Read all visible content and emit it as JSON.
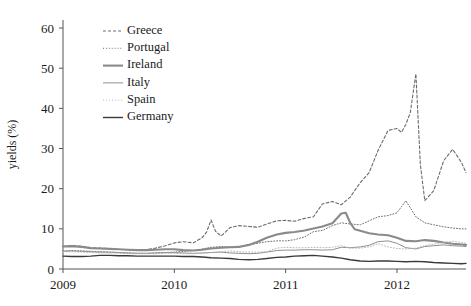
{
  "chart_data": {
    "type": "line",
    "title": "",
    "xlabel": "",
    "ylabel": "yields (%)",
    "xlim": [
      2009.0,
      2012.62
    ],
    "ylim": [
      0,
      62
    ],
    "grid": false,
    "legend_position": "top-left-inside",
    "xticks": [
      2009,
      2010,
      2011,
      2012
    ],
    "xticklabels": [
      "2009",
      "2010",
      "2011",
      "2012"
    ],
    "yticks": [
      0,
      10,
      20,
      30,
      40,
      50,
      60
    ],
    "yticklabels": [
      "0",
      "10",
      "20",
      "30",
      "40",
      "50",
      "60"
    ],
    "series": [
      {
        "name": "Greece",
        "style": "dashed",
        "color": "#6b6b6b",
        "width": 1.1,
        "x": [
          2009.0,
          2009.08,
          2009.17,
          2009.25,
          2009.33,
          2009.42,
          2009.5,
          2009.58,
          2009.67,
          2009.75,
          2009.83,
          2009.92,
          2010.0,
          2010.08,
          2010.17,
          2010.25,
          2010.29,
          2010.33,
          2010.37,
          2010.42,
          2010.5,
          2010.58,
          2010.67,
          2010.75,
          2010.83,
          2010.92,
          2011.0,
          2011.08,
          2011.17,
          2011.25,
          2011.33,
          2011.42,
          2011.5,
          2011.58,
          2011.67,
          2011.75,
          2011.83,
          2011.92,
          2012.0,
          2012.04,
          2012.08,
          2012.12,
          2012.17,
          2012.21,
          2012.25,
          2012.33,
          2012.42,
          2012.5,
          2012.58,
          2012.62
        ],
        "values": [
          5.6,
          5.9,
          5.6,
          5.3,
          5.2,
          5.1,
          4.9,
          4.8,
          4.7,
          4.8,
          5.2,
          5.8,
          6.5,
          6.8,
          6.5,
          7.8,
          9.2,
          12.2,
          9.4,
          8.2,
          10.3,
          10.8,
          10.6,
          10.4,
          11.2,
          12.0,
          12.1,
          11.9,
          12.6,
          13.0,
          16.2,
          16.8,
          16.0,
          17.9,
          21.5,
          24.0,
          29.5,
          34.5,
          35.0,
          34.0,
          36.0,
          39.0,
          48.6,
          26.0,
          17.0,
          19.5,
          27.0,
          29.8,
          26.5,
          24.0
        ]
      },
      {
        "name": "Portugal",
        "style": "dotted",
        "color": "#707070",
        "width": 1.0,
        "x": [
          2009.0,
          2009.08,
          2009.17,
          2009.25,
          2009.33,
          2009.42,
          2009.5,
          2009.58,
          2009.67,
          2009.75,
          2009.83,
          2009.92,
          2010.0,
          2010.08,
          2010.17,
          2010.25,
          2010.33,
          2010.42,
          2010.5,
          2010.58,
          2010.67,
          2010.75,
          2010.83,
          2010.92,
          2011.0,
          2011.08,
          2011.17,
          2011.25,
          2011.33,
          2011.42,
          2011.5,
          2011.58,
          2011.67,
          2011.75,
          2011.83,
          2011.92,
          2012.0,
          2012.04,
          2012.08,
          2012.17,
          2012.25,
          2012.33,
          2012.42,
          2012.5,
          2012.58,
          2012.62
        ],
        "values": [
          4.5,
          4.6,
          4.5,
          4.4,
          4.3,
          4.2,
          4.1,
          4.0,
          3.9,
          3.9,
          4.0,
          4.1,
          4.2,
          4.4,
          4.6,
          5.0,
          5.4,
          5.6,
          5.5,
          5.6,
          6.0,
          6.4,
          6.8,
          7.0,
          7.0,
          7.3,
          8.0,
          9.3,
          9.6,
          10.8,
          11.5,
          11.2,
          11.0,
          12.0,
          13.0,
          13.3,
          14.0,
          15.5,
          17.0,
          13.0,
          11.5,
          11.0,
          10.5,
          10.2,
          10.0,
          10.0
        ]
      },
      {
        "name": "Ireland",
        "style": "solid",
        "color": "#8a8a8a",
        "width": 2.1,
        "x": [
          2009.0,
          2009.08,
          2009.17,
          2009.25,
          2009.33,
          2009.42,
          2009.5,
          2009.58,
          2009.67,
          2009.75,
          2009.83,
          2009.92,
          2010.0,
          2010.08,
          2010.17,
          2010.25,
          2010.33,
          2010.42,
          2010.5,
          2010.58,
          2010.67,
          2010.75,
          2010.83,
          2010.92,
          2011.0,
          2011.08,
          2011.17,
          2011.25,
          2011.33,
          2011.42,
          2011.5,
          2011.54,
          2011.58,
          2011.62,
          2011.67,
          2011.75,
          2011.83,
          2011.92,
          2012.0,
          2012.08,
          2012.17,
          2012.25,
          2012.33,
          2012.42,
          2012.5,
          2012.58,
          2012.62
        ],
        "values": [
          5.6,
          5.7,
          5.5,
          5.2,
          5.1,
          5.0,
          4.9,
          4.8,
          4.7,
          4.7,
          4.8,
          4.9,
          4.9,
          4.7,
          4.6,
          4.8,
          5.1,
          5.3,
          5.4,
          5.5,
          6.0,
          6.8,
          7.8,
          8.6,
          9.0,
          9.2,
          9.6,
          10.1,
          10.6,
          11.4,
          13.8,
          14.0,
          11.5,
          9.9,
          9.5,
          8.9,
          8.6,
          8.4,
          7.8,
          7.0,
          6.9,
          7.2,
          7.0,
          6.6,
          6.3,
          6.1,
          6.0
        ]
      },
      {
        "name": "Italy",
        "style": "solid",
        "color": "#909090",
        "width": 1.0,
        "x": [
          2009.0,
          2009.08,
          2009.17,
          2009.25,
          2009.33,
          2009.42,
          2009.5,
          2009.58,
          2009.67,
          2009.75,
          2009.83,
          2009.92,
          2010.0,
          2010.08,
          2010.17,
          2010.25,
          2010.33,
          2010.42,
          2010.5,
          2010.58,
          2010.67,
          2010.75,
          2010.83,
          2010.92,
          2011.0,
          2011.08,
          2011.17,
          2011.25,
          2011.33,
          2011.42,
          2011.5,
          2011.58,
          2011.67,
          2011.75,
          2011.83,
          2011.92,
          2012.0,
          2012.08,
          2012.17,
          2012.25,
          2012.33,
          2012.42,
          2012.5,
          2012.58,
          2012.62
        ],
        "values": [
          4.4,
          4.5,
          4.4,
          4.3,
          4.2,
          4.2,
          4.1,
          4.0,
          3.9,
          3.9,
          4.0,
          4.1,
          4.1,
          4.0,
          3.9,
          4.0,
          4.1,
          4.2,
          4.0,
          3.9,
          3.8,
          3.9,
          4.2,
          4.6,
          4.7,
          4.7,
          4.8,
          4.8,
          4.7,
          4.8,
          5.4,
          5.3,
          5.5,
          5.9,
          6.8,
          7.0,
          6.4,
          5.3,
          5.0,
          5.6,
          5.8,
          6.0,
          5.8,
          5.7,
          5.6
        ]
      },
      {
        "name": "Spain",
        "style": "dotted-light",
        "color": "#b5b5b5",
        "width": 1.0,
        "x": [
          2009.0,
          2009.08,
          2009.17,
          2009.25,
          2009.33,
          2009.42,
          2009.5,
          2009.58,
          2009.67,
          2009.75,
          2009.83,
          2009.92,
          2010.0,
          2010.08,
          2010.17,
          2010.25,
          2010.33,
          2010.42,
          2010.5,
          2010.58,
          2010.67,
          2010.75,
          2010.83,
          2010.92,
          2011.0,
          2011.08,
          2011.17,
          2011.25,
          2011.33,
          2011.42,
          2011.5,
          2011.58,
          2011.67,
          2011.75,
          2011.83,
          2011.92,
          2012.0,
          2012.08,
          2012.17,
          2012.25,
          2012.33,
          2012.42,
          2012.5,
          2012.58,
          2012.62
        ],
        "values": [
          4.3,
          4.3,
          4.2,
          4.1,
          4.0,
          4.0,
          3.9,
          3.8,
          3.8,
          3.8,
          3.8,
          3.9,
          3.9,
          3.8,
          3.8,
          3.9,
          4.1,
          4.3,
          4.5,
          4.3,
          4.2,
          4.2,
          4.3,
          5.2,
          5.4,
          5.3,
          5.3,
          5.4,
          5.3,
          5.4,
          5.8,
          5.2,
          5.2,
          5.5,
          6.3,
          5.5,
          5.1,
          5.0,
          5.2,
          5.8,
          6.2,
          6.6,
          6.9,
          6.6,
          6.4
        ]
      },
      {
        "name": "Germany",
        "style": "solid",
        "color": "#3a3a3a",
        "width": 1.4,
        "x": [
          2009.0,
          2009.08,
          2009.17,
          2009.25,
          2009.33,
          2009.42,
          2009.5,
          2009.58,
          2009.67,
          2009.75,
          2009.83,
          2009.92,
          2010.0,
          2010.08,
          2010.17,
          2010.25,
          2010.33,
          2010.42,
          2010.5,
          2010.58,
          2010.67,
          2010.75,
          2010.83,
          2010.92,
          2011.0,
          2011.08,
          2011.17,
          2011.25,
          2011.33,
          2011.42,
          2011.5,
          2011.58,
          2011.67,
          2011.75,
          2011.83,
          2011.92,
          2012.0,
          2012.08,
          2012.17,
          2012.25,
          2012.33,
          2012.42,
          2012.5,
          2012.58,
          2012.62
        ],
        "values": [
          3.2,
          3.1,
          3.1,
          3.2,
          3.4,
          3.4,
          3.3,
          3.3,
          3.2,
          3.2,
          3.2,
          3.2,
          3.2,
          3.1,
          3.1,
          3.0,
          2.8,
          2.7,
          2.6,
          2.4,
          2.3,
          2.4,
          2.6,
          2.9,
          3.0,
          3.2,
          3.3,
          3.4,
          3.2,
          3.0,
          2.7,
          2.3,
          2.0,
          1.9,
          2.0,
          2.0,
          1.9,
          1.8,
          1.9,
          1.8,
          1.6,
          1.5,
          1.4,
          1.3,
          1.4
        ]
      }
    ]
  },
  "legend": {
    "items": [
      {
        "label": "Greece"
      },
      {
        "label": "Portugal"
      },
      {
        "label": "Ireland"
      },
      {
        "label": "Italy"
      },
      {
        "label": "Spain"
      },
      {
        "label": "Germany"
      }
    ]
  }
}
